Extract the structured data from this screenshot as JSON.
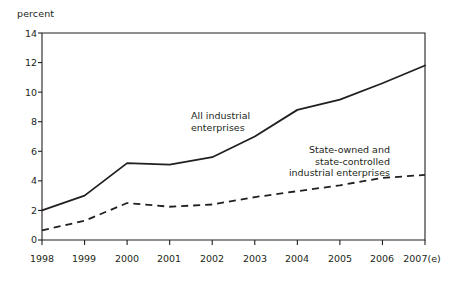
{
  "chart_data": {
    "type": "line",
    "title": "",
    "subtitle": "",
    "xlabel": "",
    "ylabel": "percent",
    "categories": [
      "1998",
      "1999",
      "2000",
      "2001",
      "2002",
      "2003",
      "2004",
      "2005",
      "2006",
      "2007(e)"
    ],
    "x": [
      1998,
      1999,
      2000,
      2001,
      2002,
      2003,
      2004,
      2005,
      2006,
      2007
    ],
    "ylim": [
      0,
      14
    ],
    "yticks": [
      0,
      2,
      4,
      6,
      8,
      10,
      12,
      14
    ],
    "ytick_labels": [
      "0",
      "2",
      "4",
      "6",
      "8",
      "10",
      "12",
      "14"
    ],
    "grid": false,
    "legend_position": "inline-annotations",
    "series": [
      {
        "name": "All industrial enterprises",
        "style": "solid",
        "color": "#231f20",
        "values": [
          2.0,
          3.0,
          5.2,
          5.1,
          5.6,
          7.0,
          8.8,
          9.5,
          10.6,
          11.8
        ]
      },
      {
        "name": "State-owned and state-controlled industrial enterprises",
        "style": "dashed",
        "color": "#231f20",
        "values": [
          0.65,
          1.3,
          2.5,
          2.25,
          2.4,
          2.9,
          3.3,
          3.7,
          4.2,
          4.4
        ]
      }
    ],
    "annotations": [
      {
        "id": "all-industrial",
        "lines": [
          "All industrial",
          "enterprises"
        ],
        "align": "left"
      },
      {
        "id": "state-owned",
        "lines": [
          "State-owned and",
          "state-controlled",
          "industrial enterprises"
        ],
        "align": "right"
      }
    ]
  },
  "axis": {
    "y_title": "percent"
  }
}
